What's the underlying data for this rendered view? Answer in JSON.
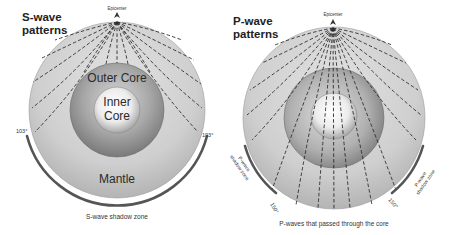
{
  "left_panel": {
    "title_line1": "S-wave",
    "title_line2": "patterns",
    "epicenter_label": "Epicenter",
    "outer_core_label": "Outer Core",
    "inner_core_line1": "Inner",
    "inner_core_line2": "Core",
    "mantle_label": "Mantle",
    "angle_left": "103°",
    "angle_right": "103°",
    "caption": "S-wave shadow zone"
  },
  "right_panel": {
    "title_line1": "P-wave",
    "title_line2": "patterns",
    "epicenter_label": "Epicenter",
    "shadow_zone_left_line1": "P-wave",
    "shadow_zone_left_line2": "shadow zone",
    "shadow_zone_right_line1": "P-wave",
    "shadow_zone_right_line2": "shadow zone",
    "angle_left": "150°",
    "angle_right": "150°",
    "caption": "P-waves that passed through the core"
  },
  "colors": {
    "mantle": "#c9c9c9",
    "outer_core": "#8f8f8f",
    "inner_core": "#f4f4f4",
    "ray": "#2a2a2a",
    "shadow_arc": "#555555"
  }
}
